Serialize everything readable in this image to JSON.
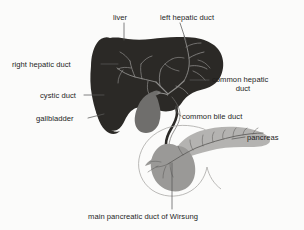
{
  "figure": {
    "background_color": "#fbfbfa",
    "label_color": "#1d1d1d"
  },
  "labels": {
    "liver": "liver",
    "left_hepatic_duct": "left hepatic duct",
    "right_hepatic_duct": "right hepatic duct",
    "cystic_duct": "cystic duct",
    "gallbladder": "gallbladder",
    "common_hepatic_duct_line1": "common hepatic",
    "common_hepatic_duct_line2": "duct",
    "common_bile_duct": "common bile duct",
    "pancreas": "pancreas",
    "main_pancreatic_duct": "main pancreatic duct of Wirsung"
  },
  "structures": {
    "liver": {
      "name": "liver",
      "color": "#2b2926"
    },
    "gallbladder": {
      "name": "gallbladder",
      "color": "#6f6e6c"
    },
    "pancreas_body": {
      "name": "pancreas",
      "color": "#b4b3b1"
    },
    "pancreas_head": {
      "name": "pancreas-head",
      "color": "#9a9997"
    },
    "duodenum": {
      "name": "duodenum",
      "color": "#8d8c8a"
    },
    "bile_ducts": {
      "name": "bile-duct-tree",
      "color": "#8e8d8b"
    },
    "leader_lines": {
      "name": "leader-line",
      "color": "#5a5958"
    }
  }
}
